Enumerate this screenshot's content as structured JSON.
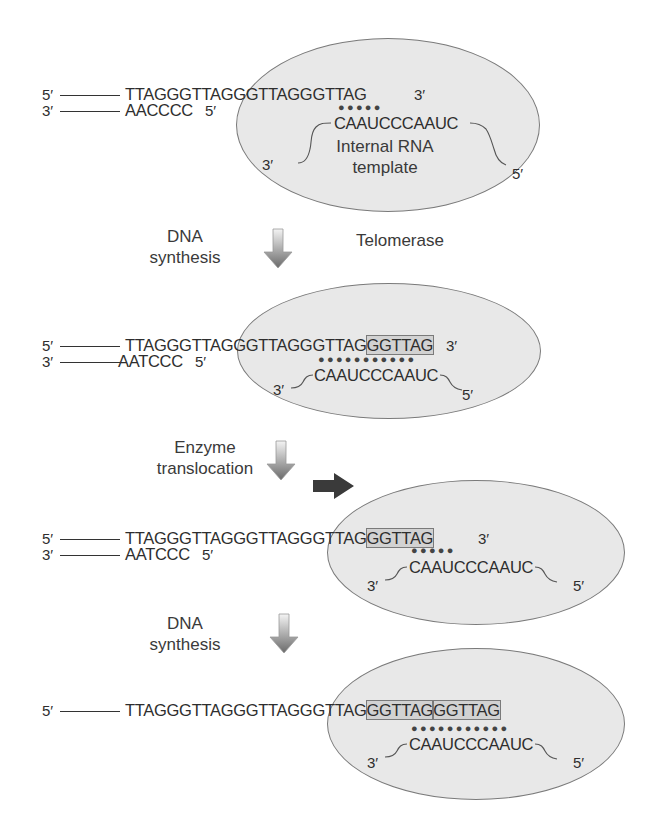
{
  "colors": {
    "enzyme_fill": "#e8e8e8",
    "enzyme_stroke": "#7a7a7a",
    "highlight_fill": "#d2d2d2",
    "text": "#2e2e2e",
    "arrow_dark": "#3a3a3a"
  },
  "labels": {
    "prime5": "5′",
    "prime3": "3′",
    "telomerase": "Telomerase",
    "dna_synthesis_1a": "DNA",
    "dna_synthesis_1b": "synthesis",
    "enzyme_translocation_a": "Enzyme",
    "enzyme_translocation_b": "translocation",
    "dna_synthesis_2a": "DNA",
    "dna_synthesis_2b": "synthesis",
    "rna_template_a": "Internal RNA",
    "rna_template_b": "template"
  },
  "panels": [
    {
      "top_strand": "TTAGGGTTAGGGTTAGGGTTAG",
      "top_strand_new": "",
      "bottom_strand": "AACCCC",
      "rna_template": "CAAUCCCAAUC",
      "base_pairs": "●●●●●"
    },
    {
      "top_strand": "TTAGGGTTAGGGTTAGGGTTAG",
      "top_strand_new": "GGTTAG",
      "bottom_strand": "AATCCC",
      "rna_template": "CAAUCCCAAUC",
      "base_pairs": "●●●●●●●●●●●"
    },
    {
      "top_strand": "TTAGGGTTAGGGTTAGGGTTAG",
      "top_strand_new": "GGTTAG",
      "bottom_strand": "AATCCC",
      "rna_template": "CAAUCCCAAUC",
      "base_pairs": "●●●●●"
    },
    {
      "top_strand": "TTAGGGTTAGGGTTAGGGTTAG",
      "top_strand_new": "GGTTAG",
      "top_strand_new2": "GGTTAG",
      "rna_template": "CAAUCCCAAUC",
      "base_pairs": "●●●●●●●●●●●"
    }
  ]
}
